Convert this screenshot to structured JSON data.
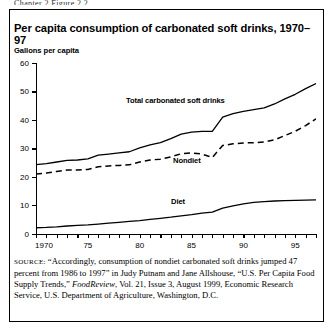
{
  "top_cut_text": "Chapter 2   Figure 2.2",
  "figure": {
    "title": "Per capita consumption of carbonated soft drinks, 1970–97",
    "y_axis_title": "Gallons per capita",
    "source_label": "SOURCE:",
    "source_part1": " “Accordingly, consumption of nondiet carbonated soft drinks jumped 47 percent from 1986 to 1997” in Judy Putnam and Jane Allshouse, “U.S. Per Capita Food Supply Trends,” ",
    "source_italic": "FoodReview",
    "source_part2": ", Vol. 21, Issue 3, August 1999, Economic Research Service, U.S. Department of Agriculture, Washington, D.C."
  },
  "chart_data": {
    "type": "line",
    "title": "Per capita consumption of carbonated soft drinks, 1970–97",
    "xlabel": "",
    "ylabel": "Gallons per capita",
    "xlim": [
      1970,
      1997
    ],
    "ylim": [
      0,
      60
    ],
    "yticks": [
      0,
      10,
      20,
      30,
      40,
      50,
      60
    ],
    "ytick_labels": [
      "0",
      "10",
      "20",
      "30",
      "40",
      "50",
      "60"
    ],
    "xticks": [
      1970,
      1971,
      1972,
      1973,
      1974,
      1975,
      1976,
      1977,
      1978,
      1979,
      1980,
      1981,
      1982,
      1983,
      1984,
      1985,
      1986,
      1987,
      1988,
      1989,
      1990,
      1991,
      1992,
      1993,
      1994,
      1995,
      1996,
      1997
    ],
    "xtick_labels": [
      {
        "x": 1970,
        "label": "1970"
      },
      {
        "x": 1975,
        "label": "75"
      },
      {
        "x": 1980,
        "label": "80"
      },
      {
        "x": 1985,
        "label": "85"
      },
      {
        "x": 1990,
        "label": "90"
      },
      {
        "x": 1995,
        "label": "95"
      }
    ],
    "grid": false,
    "legend": "inline-labels",
    "x": [
      1970,
      1971,
      1972,
      1973,
      1974,
      1975,
      1976,
      1977,
      1978,
      1979,
      1980,
      1981,
      1982,
      1983,
      1984,
      1985,
      1986,
      1987,
      1988,
      1989,
      1990,
      1991,
      1992,
      1993,
      1994,
      1995,
      1996,
      1997
    ],
    "series": [
      {
        "name": "Total carbonated soft drinks",
        "style": "solid",
        "color": "#000000",
        "label_text": "Total carbonated soft drinks",
        "values": [
          24.3,
          24.6,
          25.2,
          25.8,
          25.9,
          26.3,
          27.6,
          28.0,
          28.4,
          28.8,
          30.2,
          31.2,
          32.0,
          33.4,
          35.0,
          35.7,
          36.0,
          36.0,
          41.0,
          42.2,
          43.0,
          43.6,
          44.2,
          45.6,
          47.4,
          49.0,
          51.0,
          52.8
        ]
      },
      {
        "name": "Nondiet",
        "style": "dashed",
        "color": "#000000",
        "label_text": "Nondiet",
        "values": [
          21.0,
          21.3,
          21.9,
          22.4,
          22.4,
          22.6,
          23.5,
          23.8,
          24.0,
          24.2,
          25.2,
          25.9,
          26.2,
          27.0,
          28.1,
          28.4,
          28.0,
          26.8,
          31.0,
          31.6,
          31.9,
          32.0,
          32.2,
          33.0,
          34.5,
          36.0,
          38.0,
          40.4
        ]
      },
      {
        "name": "Diet",
        "style": "solid",
        "color": "#000000",
        "label_text": "Diet",
        "values": [
          2.1,
          2.2,
          2.4,
          2.7,
          2.9,
          3.1,
          3.4,
          3.7,
          4.0,
          4.3,
          4.6,
          5.0,
          5.4,
          5.8,
          6.3,
          6.7,
          7.2,
          7.6,
          9.0,
          9.8,
          10.5,
          11.0,
          11.3,
          11.5,
          11.6,
          11.7,
          11.8,
          11.9
        ]
      }
    ],
    "series_label_positions": [
      {
        "name": "Total carbonated soft drinks",
        "left": 126,
        "top": 96
      },
      {
        "name": "Nondiet",
        "left": 173,
        "top": 156
      },
      {
        "name": "Diet",
        "left": 171,
        "top": 197
      }
    ]
  }
}
